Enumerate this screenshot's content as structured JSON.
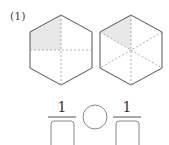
{
  "problem": {
    "label": "(1)",
    "hexagon_left": {
      "shading": "upper-left quarter",
      "divisions": 4
    },
    "hexagon_right": {
      "shading": "one sixth",
      "divisions": 6
    },
    "comparison": {
      "left_numerator": "1",
      "right_numerator": "1",
      "left_denominator": "",
      "right_denominator": "",
      "operator": ""
    },
    "colors": {
      "shade": "#e8e8e8",
      "line": "#555555",
      "dash": "#999999"
    }
  }
}
